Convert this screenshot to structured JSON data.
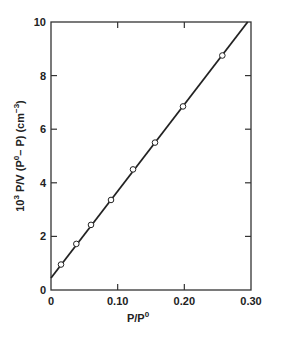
{
  "chart_data": {
    "type": "scatter",
    "title": "",
    "xlabel": "P/P⁰",
    "ylabel": "10³ P/V (P⁰– P) (cm⁻³)",
    "xlim": [
      0,
      0.3
    ],
    "ylim": [
      0,
      10
    ],
    "x_ticks": [
      0,
      0.1,
      0.2,
      0.3
    ],
    "x_tick_labels": [
      "0",
      "0.10",
      "0.20",
      "0.30"
    ],
    "y_ticks": [
      0,
      2,
      4,
      6,
      8,
      10
    ],
    "y_tick_labels": [
      "0",
      "2",
      "4",
      "6",
      "8",
      "10"
    ],
    "grid": false,
    "legend": null,
    "series": [
      {
        "name": "data points",
        "marker": "open-circle",
        "x": [
          0.015,
          0.038,
          0.06,
          0.09,
          0.123,
          0.156,
          0.198,
          0.257
        ],
        "y": [
          0.95,
          1.72,
          2.43,
          3.36,
          4.5,
          5.5,
          6.85,
          8.75
        ]
      },
      {
        "name": "linear fit",
        "style": "line",
        "x": [
          0,
          0.295
        ],
        "y": [
          0.45,
          10.0
        ]
      }
    ]
  },
  "labels": {
    "xlabel_main": "P/P",
    "xlabel_sup": "0",
    "ylabel_prefix": "10",
    "ylabel_sup1": "3",
    "ylabel_mid": " P/V (P",
    "ylabel_sup2": "0",
    "ylabel_mid2": "– P) (cm",
    "ylabel_sup3": "−3",
    "ylabel_end": ")"
  }
}
